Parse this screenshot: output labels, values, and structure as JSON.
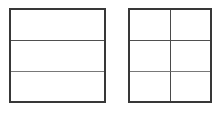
{
  "figure": {
    "background_color": "#ffffff",
    "canvas": {
      "width": 223,
      "height": 114
    },
    "border_color": "#383838",
    "border_width_px": 2,
    "divider_color_upper": "#4f4f4f",
    "divider_color_lower": "#787878",
    "divider_color_vertical": "#4a4a4a",
    "divider_width_px": 1,
    "shapes": [
      {
        "id": "left-grid",
        "name": "left-square-thirds",
        "shape": "square",
        "rows": 3,
        "columns": 1,
        "total_cells": 3,
        "shaded_cells": 0,
        "x": 9,
        "y": 8,
        "width": 97,
        "height": 95,
        "cells": [
          {
            "index": 1,
            "row": 1,
            "column": 1,
            "shaded": false
          },
          {
            "index": 2,
            "row": 2,
            "column": 1,
            "shaded": false
          },
          {
            "index": 3,
            "row": 3,
            "column": 1,
            "shaded": false
          }
        ]
      },
      {
        "id": "right-grid",
        "name": "right-square-sixths",
        "shape": "square",
        "rows": 3,
        "columns": 2,
        "total_cells": 6,
        "shaded_cells": 0,
        "x": 128,
        "y": 8,
        "width": 84,
        "height": 95,
        "cells": [
          {
            "index": 1,
            "row": 1,
            "column": 1,
            "shaded": false
          },
          {
            "index": 2,
            "row": 1,
            "column": 2,
            "shaded": false
          },
          {
            "index": 3,
            "row": 2,
            "column": 1,
            "shaded": false
          },
          {
            "index": 4,
            "row": 2,
            "column": 2,
            "shaded": false
          },
          {
            "index": 5,
            "row": 3,
            "column": 1,
            "shaded": false
          },
          {
            "index": 6,
            "row": 3,
            "column": 2,
            "shaded": false
          }
        ]
      }
    ]
  }
}
